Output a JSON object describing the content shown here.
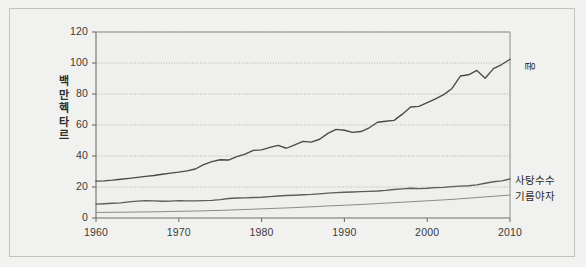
{
  "chart_data": {
    "type": "line",
    "title": "",
    "xlabel": "",
    "ylabel": "백만 헥타르",
    "xlim": [
      1960,
      2010
    ],
    "ylim": [
      0,
      120
    ],
    "yticks": [
      0,
      20,
      40,
      60,
      80,
      100,
      120
    ],
    "xticks": [
      1960,
      1970,
      1980,
      1990,
      2000,
      2010
    ],
    "grid": true,
    "grid_style": "dotted-horizontal",
    "legend_position": "right-inline-labels",
    "x": [
      1960,
      1961,
      1962,
      1963,
      1964,
      1965,
      1966,
      1967,
      1968,
      1969,
      1970,
      1971,
      1972,
      1973,
      1974,
      1975,
      1976,
      1977,
      1978,
      1979,
      1980,
      1981,
      1982,
      1983,
      1984,
      1985,
      1986,
      1987,
      1988,
      1989,
      1990,
      1991,
      1992,
      1993,
      1994,
      1995,
      1996,
      1997,
      1998,
      1999,
      2000,
      2001,
      2002,
      2003,
      2004,
      2005,
      2006,
      2007,
      2008,
      2009,
      2010
    ],
    "series": [
      {
        "name": "콩",
        "label": "콩",
        "color": "#4a4a48",
        "values": [
          23.8,
          24.0,
          24.4,
          25.0,
          25.6,
          26.2,
          26.9,
          27.4,
          28.2,
          29.0,
          29.6,
          30.4,
          31.6,
          34.4,
          36.4,
          37.6,
          37.4,
          39.6,
          41.2,
          43.6,
          44.0,
          45.6,
          46.8,
          45.0,
          47.2,
          49.4,
          49.0,
          50.8,
          54.6,
          57.2,
          56.6,
          55.2,
          55.8,
          58.2,
          61.8,
          62.4,
          63.0,
          67.0,
          71.6,
          72.0,
          74.4,
          76.8,
          79.6,
          83.6,
          91.6,
          92.4,
          95.2,
          90.2,
          96.4,
          99.0,
          102.4
        ]
      },
      {
        "name": "사탕수수",
        "label": "사탕수수",
        "color": "#5c5c5a",
        "values": [
          9.0,
          9.2,
          9.5,
          9.8,
          10.4,
          10.9,
          11.2,
          11.0,
          10.8,
          10.9,
          11.2,
          11.1,
          11.0,
          11.2,
          11.4,
          11.9,
          12.6,
          12.9,
          13.0,
          13.2,
          13.4,
          13.8,
          14.2,
          14.5,
          14.7,
          15.0,
          15.2,
          15.6,
          16.0,
          16.4,
          16.6,
          16.8,
          17.0,
          17.2,
          17.4,
          17.8,
          18.4,
          18.8,
          19.2,
          19.0,
          19.2,
          19.6,
          19.8,
          20.2,
          20.6,
          20.8,
          21.4,
          22.4,
          23.4,
          24.0,
          25.2
        ]
      },
      {
        "name": "기름야자",
        "label": "기름야자",
        "color": "#8a8a87",
        "values": [
          3.6,
          3.6,
          3.7,
          3.7,
          3.8,
          3.9,
          3.9,
          4.0,
          4.1,
          4.2,
          4.3,
          4.4,
          4.5,
          4.6,
          4.8,
          4.9,
          5.1,
          5.3,
          5.5,
          5.7,
          5.9,
          6.1,
          6.3,
          6.5,
          6.7,
          7.0,
          7.2,
          7.5,
          7.8,
          8.0,
          8.2,
          8.5,
          8.7,
          9.0,
          9.3,
          9.6,
          9.9,
          10.2,
          10.5,
          10.8,
          11.1,
          11.4,
          11.7,
          12.0,
          12.4,
          12.8,
          13.2,
          13.6,
          14.0,
          14.4,
          14.8
        ]
      }
    ]
  }
}
